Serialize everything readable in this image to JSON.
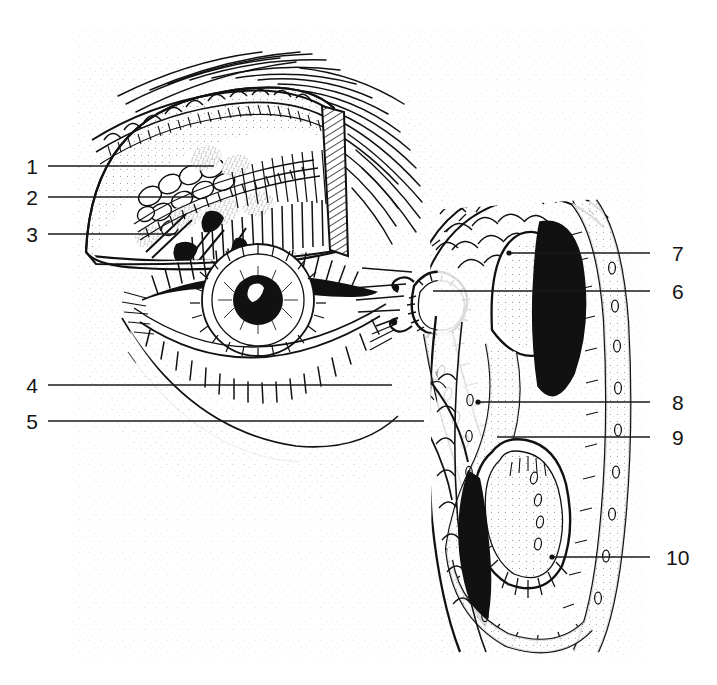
{
  "figure": {
    "style": "black-and-white stippled line engraving",
    "ink_color": "#111111",
    "paper_color": "#ffffff",
    "stipple_color": "#9a9a9a",
    "plate_area": {
      "x": 70,
      "y": 28,
      "width": 575,
      "height": 632
    }
  },
  "labels": [
    {
      "id": "1",
      "side": "left",
      "text": "1",
      "text_x": 26,
      "text_y": 156,
      "line_x1": 48,
      "line_y1": 166,
      "line_x2": 214,
      "line_y2": 166
    },
    {
      "id": "2",
      "side": "left",
      "text": "2",
      "text_x": 26,
      "text_y": 187,
      "line_x1": 48,
      "line_y1": 197,
      "line_x2": 196,
      "line_y2": 197
    },
    {
      "id": "3",
      "side": "left",
      "text": "3",
      "text_x": 26,
      "text_y": 224,
      "line_x1": 48,
      "line_y1": 234,
      "line_x2": 176,
      "line_y2": 234
    },
    {
      "id": "4",
      "side": "left",
      "text": "4",
      "text_x": 26,
      "text_y": 375,
      "line_x1": 48,
      "line_y1": 385,
      "line_x2": 392,
      "line_y2": 385
    },
    {
      "id": "5",
      "side": "left",
      "text": "5",
      "text_x": 26,
      "text_y": 411,
      "line_x1": 48,
      "line_y1": 421,
      "line_x2": 424,
      "line_y2": 421
    },
    {
      "id": "7",
      "side": "right",
      "text": "7",
      "text_x": 676,
      "text_y": 243,
      "line_x1": 650,
      "line_y1": 253,
      "line_x2": 509,
      "line_y2": 253
    },
    {
      "id": "6",
      "side": "right",
      "text": "6",
      "text_x": 676,
      "text_y": 281,
      "line_x1": 650,
      "line_y1": 291,
      "line_x2": 433,
      "line_y2": 291
    },
    {
      "id": "8",
      "side": "right",
      "text": "8",
      "text_x": 676,
      "text_y": 392,
      "line_x1": 650,
      "line_y1": 402,
      "line_x2": 478,
      "line_y2": 402
    },
    {
      "id": "9",
      "side": "right",
      "text": "9",
      "text_x": 676,
      "text_y": 427,
      "line_x1": 650,
      "line_y1": 437,
      "line_x2": 497,
      "line_y2": 437
    },
    {
      "id": "10",
      "side": "right",
      "text": "10",
      "text_x": 669,
      "text_y": 547,
      "line_x1": 650,
      "line_y1": 557,
      "line_x2": 552,
      "line_y2": 557
    }
  ],
  "structures": [
    {
      "name": "eyebrow",
      "description": "hair strokes sweeping laterally above upper lid"
    },
    {
      "name": "upper-eyelid-cutaway",
      "description": "dissected upper lid revealing lacrimal gland"
    },
    {
      "name": "lacrimal-gland-lobules",
      "description": "clustered acini under the upper lid, label 1"
    },
    {
      "name": "excretory-ducts",
      "description": "fine ducts running to the fornix, label 2"
    },
    {
      "name": "tarsal-plate-meibomian-glands",
      "description": "parallel vertical glands within the lid, label 3"
    },
    {
      "name": "iris-and-pupil",
      "description": "radially striated iris with dark pupil and highlight"
    },
    {
      "name": "lower-eyelid-lashes",
      "description": "lash row along lower lid margin"
    },
    {
      "name": "lacrimal-canaliculi",
      "description": "hook-shaped canaliculi near the medial canthus, label 6"
    },
    {
      "name": "lacrimal-sac",
      "description": "sac at medial canthus continuing into duct"
    },
    {
      "name": "nasolacrimal-duct",
      "description": "descending duct, labels 4, 5, 8, 9"
    },
    {
      "name": "superior-nasal-concha",
      "description": "dome-shaped turbinate, label 7"
    },
    {
      "name": "middle-nasal-concha",
      "description": "central stippled turbinate"
    },
    {
      "name": "inferior-nasal-concha",
      "description": "lowest turbinate with radiating strokes, label 10"
    },
    {
      "name": "nasal-cavity-wall",
      "description": "stippled mucosal wall with vessel profiles"
    }
  ]
}
